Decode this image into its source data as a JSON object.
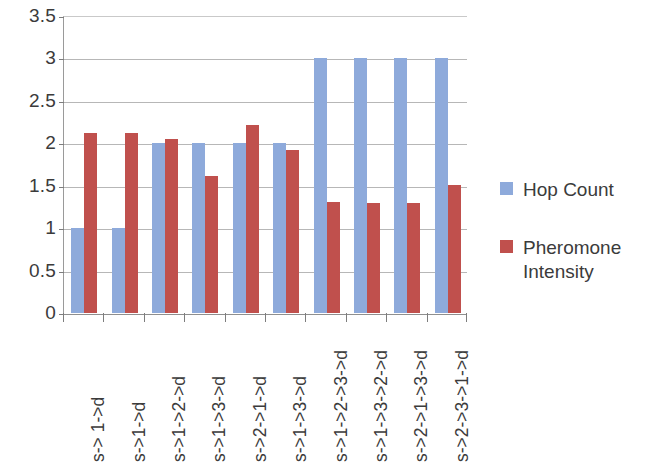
{
  "chart_data": {
    "type": "bar",
    "title": "",
    "subtitle": "",
    "xlabel": "",
    "ylabel": "",
    "ylim": [
      0,
      3.5
    ],
    "ytick_labels": [
      "3.5",
      "3",
      "2.5",
      "2",
      "1.5",
      "1",
      "0.5",
      "0"
    ],
    "ytick_values": [
      3.5,
      3,
      2.5,
      2,
      1.5,
      1,
      0.5,
      0
    ],
    "grid": true,
    "legend_position": "right",
    "categories": [
      "s-> 1->d",
      "s->1->d",
      "s->1->2->d",
      "s->1->3->d",
      "s->2->1->d",
      "s->1->3->d",
      "s->1->2->3->d",
      "s->1->3->2->d",
      "s->2->1->3->d",
      "s->2->3->1->d"
    ],
    "series": [
      {
        "name": "Hop Count",
        "color": "#8eaadb",
        "values": [
          1,
          1,
          2,
          2,
          2,
          2,
          3,
          3,
          3,
          3
        ]
      },
      {
        "name": "Pheromone Intensity",
        "color": "#c0504d",
        "values": [
          2.12,
          2.12,
          2.05,
          1.62,
          2.22,
          1.92,
          1.31,
          1.3,
          1.3,
          1.51
        ]
      }
    ]
  },
  "legend": {
    "entries": [
      {
        "label": "Hop Count",
        "color": "#8eaadb"
      },
      {
        "label": "Pheromone Intensity",
        "color": "#c0504d"
      }
    ]
  },
  "colors": {
    "series_blue": "#8eaadb",
    "series_red": "#c0504d",
    "gridline": "#b7b7b7",
    "axis": "#8f8f8f",
    "text": "#3b3b3b",
    "background": "#ffffff"
  }
}
